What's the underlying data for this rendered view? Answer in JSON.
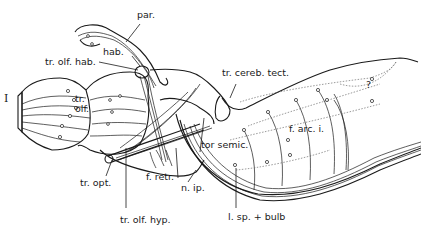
{
  "figure": {
    "type": "neuroanatomical line drawing (lateral view of brain with fiber tracts)",
    "labels": {
      "par": "par.",
      "hab": "hab.",
      "tr_olf_hab": "tr. olf. hab.",
      "roman_I": "I",
      "tr": "tr.",
      "olf": "olf.",
      "tr_cereb_tect": "tr. cereb. tect.",
      "question": "?",
      "f_arc_i": "f. arc. i.",
      "tor_semic": "tor semic.",
      "tr_opt": "tr. opt.",
      "f_retr": "f. retr.",
      "n_ip": "n. ip.",
      "tr_olf_hyp": "tr. olf. hyp.",
      "l_sp_bulb": "l. sp. + bulb"
    }
  }
}
